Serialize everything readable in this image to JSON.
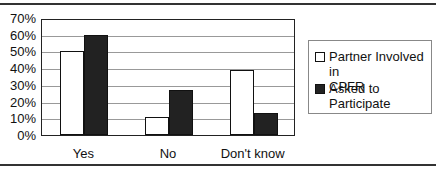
{
  "chart_data": {
    "type": "bar",
    "title": "",
    "xlabel": "",
    "ylabel": "",
    "categories": [
      "Yes",
      "No",
      "Don't know"
    ],
    "series": [
      {
        "name": "Partner Involved in CPFR",
        "values": [
          50,
          11,
          39
        ],
        "color": "#ffffff"
      },
      {
        "name": "Asked to Participate",
        "values": [
          60,
          27,
          13
        ],
        "color": "#222222"
      }
    ],
    "ylim": [
      0,
      70
    ],
    "yticks": [
      "0%",
      "10%",
      "20%",
      "30%",
      "40%",
      "50%",
      "60%",
      "70%"
    ],
    "grid": true,
    "legend_position": "right"
  },
  "legend": {
    "item0_line1": "Partner Involved in",
    "item0_line2": "CPFR",
    "item1_line1": "Asked to",
    "item1_line2": "Participate"
  }
}
